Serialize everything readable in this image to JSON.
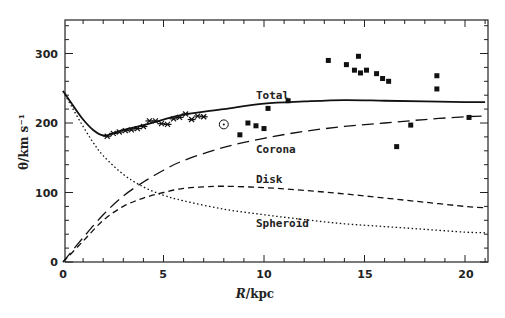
{
  "chart_data": {
    "type": "line",
    "title": "",
    "xlabel": "R/kpc",
    "ylabel": "θ/km s⁻¹",
    "xlim": [
      0,
      21.1
    ],
    "ylim": [
      0,
      345
    ],
    "xticks": [
      0,
      5,
      10,
      15,
      20
    ],
    "yticks": [
      0,
      100,
      200,
      300
    ],
    "grid": false,
    "legend": "inline labels",
    "series": [
      {
        "name": "Total",
        "style": "solid",
        "x": [
          0,
          0.5,
          1,
          1.5,
          2,
          2.5,
          3,
          4,
          5,
          6,
          8,
          10,
          12,
          14,
          16,
          18,
          20,
          21
        ],
        "y": [
          246,
          225,
          205,
          190,
          182,
          185,
          190,
          197,
          205,
          212,
          220,
          228,
          231,
          233,
          232,
          231,
          230,
          230
        ]
      },
      {
        "name": "Corona",
        "style": "long-dash",
        "x": [
          0,
          1,
          2,
          3,
          4,
          5,
          6,
          8,
          10,
          12,
          14,
          16,
          18,
          20,
          21
        ],
        "y": [
          0,
          35,
          68,
          95,
          115,
          132,
          146,
          165,
          178,
          188,
          195,
          200,
          205,
          209,
          210
        ]
      },
      {
        "name": "Disk",
        "style": "short-dash",
        "x": [
          0,
          1,
          2,
          3,
          4,
          5,
          6,
          7,
          8,
          10,
          12,
          14,
          16,
          18,
          20,
          21
        ],
        "y": [
          0,
          30,
          60,
          80,
          92,
          100,
          106,
          108,
          109,
          107,
          103,
          98,
          92,
          86,
          80,
          78
        ]
      },
      {
        "name": "Spheroid",
        "style": "dotted",
        "x": [
          0,
          0.5,
          1,
          1.5,
          2,
          3,
          4,
          5,
          6,
          8,
          10,
          12,
          14,
          16,
          18,
          20,
          21
        ],
        "y": [
          246,
          220,
          195,
          172,
          153,
          126,
          108,
          96,
          88,
          76,
          68,
          61,
          55,
          51,
          47,
          43,
          42
        ]
      }
    ],
    "observations_crosses": {
      "marker": "x",
      "x": [
        2.2,
        2.5,
        2.8,
        3.1,
        3.4,
        3.7,
        4.0,
        4.3,
        4.6,
        4.9,
        5.2,
        5.5,
        5.8,
        6.1,
        6.4,
        6.7,
        7.0
      ],
      "y": [
        181,
        185,
        187,
        189,
        190,
        192,
        195,
        203,
        203,
        199,
        198,
        206,
        208,
        213,
        205,
        210,
        209
      ]
    },
    "observations_squares": {
      "marker": "square",
      "x": [
        8.8,
        9.2,
        9.6,
        10.0,
        10.2,
        11.2,
        13.2,
        14.1,
        14.5,
        14.7,
        14.8,
        15.1,
        15.6,
        15.9,
        16.2,
        16.6,
        17.3,
        18.6,
        18.6,
        20.2
      ],
      "y": [
        183,
        200,
        196,
        192,
        221,
        232,
        290,
        284,
        276,
        296,
        272,
        276,
        271,
        264,
        260,
        166,
        197,
        268,
        249,
        208
      ]
    },
    "sun_marker": {
      "x": 8.0,
      "y": 198,
      "symbol": "⊙"
    },
    "annotations": [
      {
        "text": "Total",
        "x": 8.4,
        "y": 240
      },
      {
        "text": "Corona",
        "x": 8.3,
        "y": 150
      },
      {
        "text": "Disk",
        "x": 8.3,
        "y": 113
      },
      {
        "text": "Spheroid",
        "x": 8.3,
        "y": 60
      }
    ]
  },
  "axes": {
    "x_ticks": [
      "0",
      "5",
      "10",
      "15",
      "20"
    ],
    "y_ticks": [
      "0",
      "100",
      "200",
      "300"
    ],
    "x_title_italic": "R",
    "x_title_rest": "/kpc",
    "y_title": "θ/km s⁻¹"
  },
  "labels": {
    "total": "Total",
    "corona": "Corona",
    "disk": "Disk",
    "spheroid": "Spheroid",
    "sun": "⊙"
  }
}
